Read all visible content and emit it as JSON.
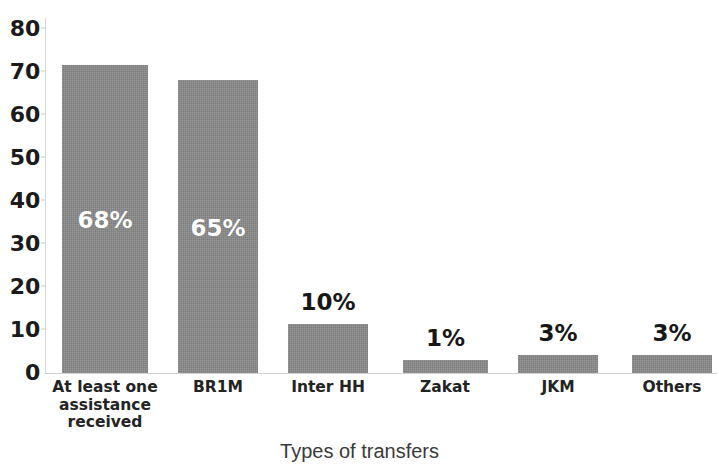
{
  "chart_data": {
    "type": "bar",
    "title": "",
    "subtitle": "",
    "xlabel": "Types of transfers",
    "ylabel": "",
    "ylim": [
      0,
      80
    ],
    "ytick_step": 10,
    "ytick_labels": [
      "0",
      "10",
      "20",
      "30",
      "40",
      "50",
      "60",
      "70",
      "80"
    ],
    "ytick_values": [
      0,
      10,
      20,
      30,
      40,
      50,
      60,
      70,
      80
    ],
    "grid": false,
    "legend": false,
    "legend_position": "none",
    "bar_color": "#8a8a8a",
    "label_color_inside": "#ffffff",
    "label_color_above": "#171717",
    "categories": [
      "At least one assistance received",
      "BR1M",
      "Inter HH",
      "Zakat",
      "JKM",
      "Others"
    ],
    "category_lines": [
      [
        "At least one",
        "assistance",
        "received"
      ],
      [
        "BR1M"
      ],
      [
        "Inter HH"
      ],
      [
        "Zakat"
      ],
      [
        "JKM"
      ],
      [
        "Others"
      ]
    ],
    "values": [
      69.5,
      66,
      11,
      3,
      4,
      4
    ],
    "data_labels": [
      "68%",
      "65%",
      "10%",
      "1%",
      "3%",
      "3%"
    ],
    "label_placement": [
      "inside",
      "inside",
      "above",
      "above",
      "above",
      "above"
    ],
    "bars": [
      {
        "category": "At least one assistance received",
        "value": 69.5,
        "label": "68%",
        "placement": "inside"
      },
      {
        "category": "BR1M",
        "value": 66,
        "label": "65%",
        "placement": "inside"
      },
      {
        "category": "Inter HH",
        "value": 11,
        "label": "10%",
        "placement": "above"
      },
      {
        "category": "Zakat",
        "value": 3,
        "label": "1%",
        "placement": "above"
      },
      {
        "category": "JKM",
        "value": 4,
        "label": "3%",
        "placement": "above"
      },
      {
        "category": "Others",
        "value": 4,
        "label": "3%",
        "placement": "above"
      }
    ]
  }
}
